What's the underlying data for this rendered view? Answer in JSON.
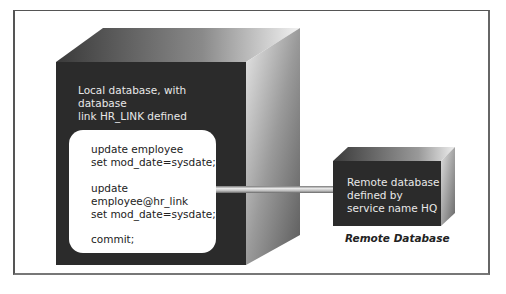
{
  "diagram": {
    "local_database": {
      "label_lines": [
        "Local database, with database",
        "link HR_LINK defined"
      ],
      "code_lines": [
        "update employee",
        "set mod_date=sysdate;",
        "",
        "update",
        "employee@hr_link",
        "set mod_date=sysdate;",
        "",
        "commit;"
      ]
    },
    "remote_database": {
      "label_lines": [
        "Remote database",
        "defined by",
        "service name HQ"
      ],
      "caption": "Remote Database"
    },
    "colors": {
      "box_front": "#2b2b2b",
      "box_side_dark": "#555555",
      "box_side_light": "#f0f0f0",
      "frame_border": "#555555",
      "panel": "#ffffff",
      "pipe": "#b8b8b8"
    }
  }
}
